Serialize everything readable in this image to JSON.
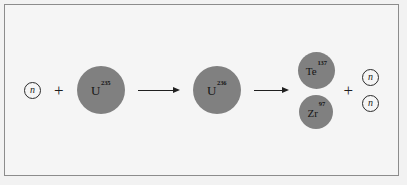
{
  "figure": {
    "caption": "",
    "border_color": "#8c8c8c",
    "background_color": "#f5f5f5",
    "nuclide_color": "#808080",
    "text_color": "#1c1c1c"
  },
  "equation": {
    "reactant_neutron": {
      "symbol": "n",
      "name": "neutron"
    },
    "plus_left": "+",
    "target_nucleus": {
      "symbol": "U",
      "mass_number": "235",
      "name": "uranium-235"
    },
    "arrow_one": "→",
    "compound_nucleus": {
      "symbol": "U",
      "mass_number": "236",
      "name": "uranium-236"
    },
    "arrow_two": "→",
    "fission_products": [
      {
        "symbol": "Te",
        "mass_number": "137",
        "name": "tellurium-137"
      },
      {
        "symbol": "Zr",
        "mass_number": "97",
        "name": "zirconium-97"
      }
    ],
    "plus_right": "+",
    "emitted_neutrons": [
      {
        "symbol": "n",
        "name": "neutron"
      },
      {
        "symbol": "n",
        "name": "neutron"
      }
    ]
  }
}
